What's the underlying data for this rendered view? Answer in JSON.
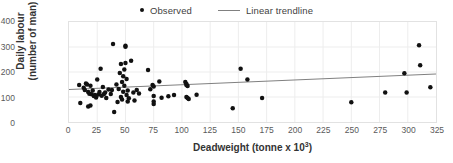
{
  "chart_data": {
    "type": "scatter",
    "title": "",
    "xlabel": "Deadweight (tonne x 10³)",
    "xlabel_main": "Deadweight (tonne x 10",
    "xlabel_sup": "3",
    "xlabel_tail": ")",
    "ylabel_line1": "Daily labour",
    "ylabel_line2": "(number of man)",
    "ylabel": "Daily labour (number of man)",
    "xlim": [
      0,
      325
    ],
    "ylim": [
      0,
      400
    ],
    "xticks": [
      0,
      25,
      50,
      75,
      100,
      125,
      150,
      175,
      200,
      225,
      250,
      275,
      300,
      325
    ],
    "yticks": [
      0,
      100,
      200,
      300,
      400
    ],
    "grid": true,
    "grid_color": "#ededed",
    "frame_color": "#e2e2e2",
    "marker_color": "#111111",
    "trendline_color": "#808080",
    "legend_position": "top-center",
    "legend": [
      {
        "label": "Observed",
        "marker": "dot",
        "color": "#111111"
      },
      {
        "label": "Linear trendline",
        "marker": "line",
        "color": "#808080"
      }
    ],
    "series": [
      {
        "name": "Observed",
        "type": "scatter",
        "points": [
          [
            9,
            148
          ],
          [
            10,
            76
          ],
          [
            13,
            137
          ],
          [
            14,
            128
          ],
          [
            15,
            154
          ],
          [
            16,
            150
          ],
          [
            17,
            120
          ],
          [
            17,
            62
          ],
          [
            18,
            113
          ],
          [
            19,
            145
          ],
          [
            19,
            66
          ],
          [
            20,
            111
          ],
          [
            21,
            126
          ],
          [
            22,
            104
          ],
          [
            23,
            108
          ],
          [
            24,
            98
          ],
          [
            25,
            170
          ],
          [
            26,
            110
          ],
          [
            27,
            120
          ],
          [
            28,
            213
          ],
          [
            29,
            105
          ],
          [
            30,
            140
          ],
          [
            31,
            112
          ],
          [
            32,
            118
          ],
          [
            33,
            96
          ],
          [
            35,
            130
          ],
          [
            37,
            112
          ],
          [
            38,
            128
          ],
          [
            39,
            312
          ],
          [
            40,
            40
          ],
          [
            42,
            150
          ],
          [
            43,
            80
          ],
          [
            44,
            132
          ],
          [
            45,
            196
          ],
          [
            46,
            232
          ],
          [
            46,
            100
          ],
          [
            47,
            160
          ],
          [
            47,
            90
          ],
          [
            48,
            183
          ],
          [
            48,
            121
          ],
          [
            49,
            210
          ],
          [
            49,
            145
          ],
          [
            50,
            301
          ],
          [
            50,
            236
          ],
          [
            50,
            305
          ],
          [
            51,
            172
          ],
          [
            51,
            108
          ],
          [
            52,
            126
          ],
          [
            52,
            82
          ],
          [
            53,
            95
          ],
          [
            55,
            245
          ],
          [
            57,
            118
          ],
          [
            58,
            86
          ],
          [
            60,
            128
          ],
          [
            62,
            114
          ],
          [
            70,
            208
          ],
          [
            72,
            131
          ],
          [
            74,
            148
          ],
          [
            75,
            142
          ],
          [
            75,
            104
          ],
          [
            75,
            82
          ],
          [
            75,
            72
          ],
          [
            80,
            162
          ],
          [
            82,
            97
          ],
          [
            88,
            103
          ],
          [
            93,
            108
          ],
          [
            103,
            160
          ],
          [
            104,
            152
          ],
          [
            104,
            148
          ],
          [
            104,
            100
          ],
          [
            105,
            144
          ],
          [
            105,
            96
          ],
          [
            106,
            92
          ],
          [
            113,
            109
          ],
          [
            145,
            55
          ],
          [
            152,
            213
          ],
          [
            158,
            170
          ],
          [
            171,
            96
          ],
          [
            250,
            79
          ],
          [
            280,
            118
          ],
          [
            297,
            195
          ],
          [
            299,
            118
          ],
          [
            310,
            307
          ],
          [
            311,
            227
          ],
          [
            320,
            139
          ]
        ]
      },
      {
        "name": "Linear trendline",
        "type": "line",
        "points": [
          [
            0,
            130
          ],
          [
            325,
            192
          ]
        ]
      }
    ]
  }
}
